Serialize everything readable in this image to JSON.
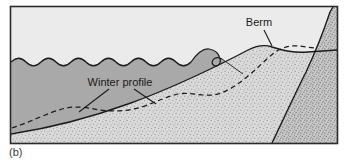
{
  "figure": {
    "caption": "(b)",
    "labels": {
      "berm": "Berm",
      "winter_profile": "Winter profile"
    },
    "colors": {
      "sky": "#ebebeb",
      "water": "#a9a9a9",
      "sand": "#d6d6d6",
      "dune": "#c2c2c2",
      "outline": "#1a1a1a",
      "frame": "#2b2b2b",
      "background": "#ffffff",
      "text": "#1a1a1a"
    },
    "regions": [
      {
        "name": "sky",
        "label": "sky"
      },
      {
        "name": "water",
        "label": "ocean water"
      },
      {
        "name": "beach-sand",
        "label": "summer beach profile sand"
      },
      {
        "name": "dune",
        "label": "coastal dune"
      }
    ],
    "features": [
      {
        "name": "wavy-water-surface",
        "label": "water surface with waves"
      },
      {
        "name": "breaking-wave",
        "label": "breaking wave"
      },
      {
        "name": "summer-profile-line",
        "label": "summer beach profile"
      },
      {
        "name": "winter-profile-line",
        "label": "winter profile (dashed)"
      },
      {
        "name": "berm-crest",
        "label": "berm crest"
      }
    ],
    "frame": {
      "x": 10,
      "y": 6,
      "width": 328,
      "height": 138
    }
  }
}
